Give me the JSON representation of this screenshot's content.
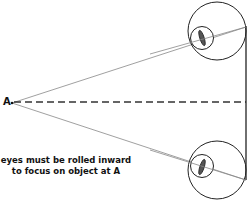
{
  "diagram": {
    "point_label": "A",
    "caption_line1": "eyes must be rolled inward",
    "caption_line2": "to focus on object at A",
    "colors": {
      "stroke": "#222222",
      "thin_line": "#777777",
      "background": "#ffffff"
    }
  }
}
